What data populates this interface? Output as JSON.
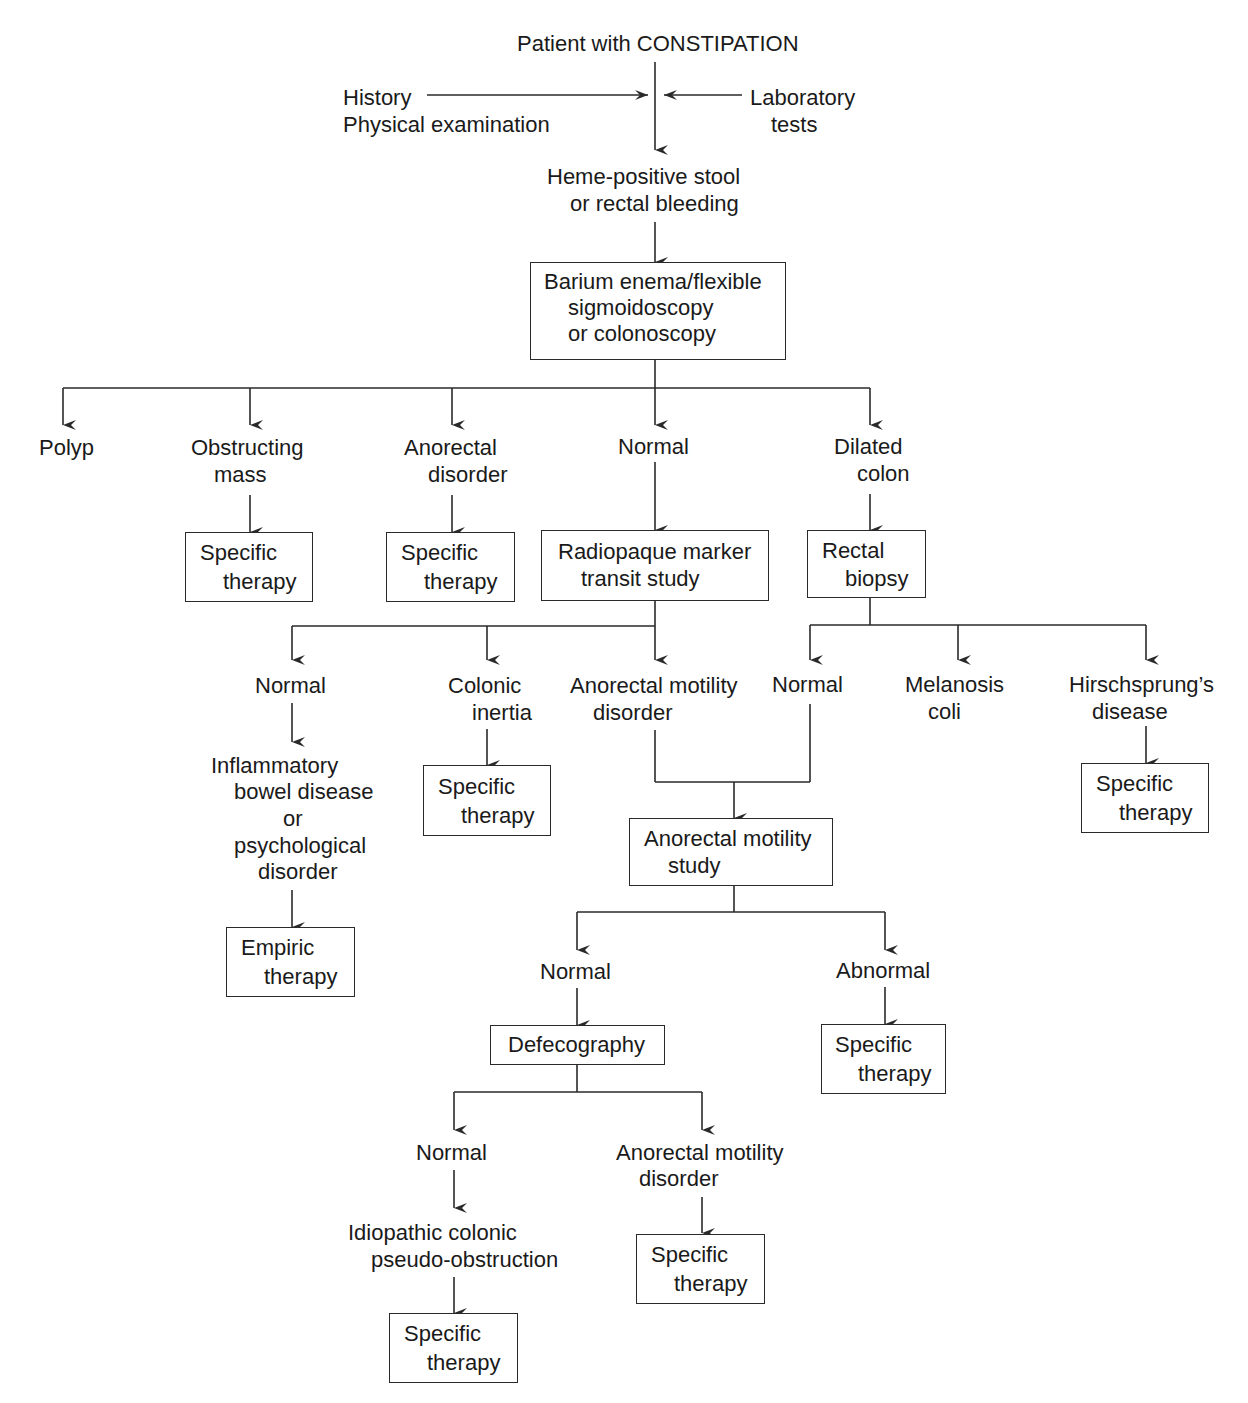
{
  "diagram": {
    "type": "clinical-decision-flowchart",
    "title": "Patient with CONSTIPATION",
    "inputs": {
      "left": [
        "History",
        "Physical examination"
      ],
      "right": [
        "Laboratory",
        "tests"
      ]
    },
    "nodes": {
      "root": "Patient with CONSTIPATION",
      "history_l1": "History",
      "history_l2": "Physical examination",
      "lab_l1": "Laboratory",
      "lab_l2": "tests",
      "heme_l1": "Heme-positive stool",
      "heme_l2": "or rectal bleeding",
      "barium_l1": "Barium enema/flexible",
      "barium_l2": "sigmoidoscopy",
      "barium_l3": "or colonoscopy",
      "polyp": "Polyp",
      "obstructing_l1": "Obstructing",
      "obstructing_l2": "mass",
      "anorectal_dis_l1": "Anorectal",
      "anorectal_dis_l2": "disorder",
      "normal1": "Normal",
      "dilated_l1": "Dilated",
      "dilated_l2": "colon",
      "spec_obstr_l1": "Specific",
      "spec_obstr_l2": "therapy",
      "spec_anorect_l1": "Specific",
      "spec_anorect_l2": "therapy",
      "radiopaque_l1": "Radiopaque marker",
      "radiopaque_l2": "transit study",
      "rectal_biopsy_l1": "Rectal",
      "rectal_biopsy_l2": "biopsy",
      "normal2": "Normal",
      "colonic_inertia_l1": "Colonic",
      "colonic_inertia_l2": "inertia",
      "anorectal_motility_dis_l1": "Anorectal motility",
      "anorectal_motility_dis_l2": "disorder",
      "normal3": "Normal",
      "melanosis_l1": "Melanosis",
      "melanosis_l2": "coli",
      "hirsch_l1": "Hirschsprung’s",
      "hirsch_l2": "disease",
      "ibd_l1": "Inflammatory",
      "ibd_l2": "bowel disease",
      "ibd_l3": "or",
      "ibd_l4": "psychological",
      "ibd_l5": "disorder",
      "spec_inertia_l1": "Specific",
      "spec_inertia_l2": "therapy",
      "spec_hirsch_l1": "Specific",
      "spec_hirsch_l2": "therapy",
      "ams_l1": "Anorectal motility",
      "ams_l2": "study",
      "empiric_l1": "Empiric",
      "empiric_l2": "therapy",
      "normal4": "Normal",
      "abnormal": "Abnormal",
      "defecography": "Defecography",
      "spec_abnormal_l1": "Specific",
      "spec_abnormal_l2": "therapy",
      "normal5": "Normal",
      "amd2_l1": "Anorectal motility",
      "amd2_l2": "disorder",
      "idiopathic_l1": "Idiopathic colonic",
      "idiopathic_l2": "pseudo-obstruction",
      "spec_amd2_l1": "Specific",
      "spec_amd2_l2": "therapy",
      "spec_idio_l1": "Specific",
      "spec_idio_l2": "therapy"
    },
    "edges": [
      [
        "Patient with CONSTIPATION",
        "Heme-positive stool or rectal bleeding"
      ],
      [
        "History / Physical examination",
        "main flow"
      ],
      [
        "Laboratory tests",
        "main flow"
      ],
      [
        "Heme-positive stool or rectal bleeding",
        "Barium enema/flexible sigmoidoscopy or colonoscopy"
      ],
      [
        "Barium enema/flexible sigmoidoscopy or colonoscopy",
        "Polyp"
      ],
      [
        "Barium enema/flexible sigmoidoscopy or colonoscopy",
        "Obstructing mass"
      ],
      [
        "Barium enema/flexible sigmoidoscopy or colonoscopy",
        "Anorectal disorder"
      ],
      [
        "Barium enema/flexible sigmoidoscopy or colonoscopy",
        "Normal"
      ],
      [
        "Barium enema/flexible sigmoidoscopy or colonoscopy",
        "Dilated colon"
      ],
      [
        "Obstructing mass",
        "Specific therapy"
      ],
      [
        "Anorectal disorder",
        "Specific therapy"
      ],
      [
        "Normal",
        "Radiopaque marker transit study"
      ],
      [
        "Dilated colon",
        "Rectal biopsy"
      ],
      [
        "Radiopaque marker transit study",
        "Normal"
      ],
      [
        "Radiopaque marker transit study",
        "Colonic inertia"
      ],
      [
        "Radiopaque marker transit study",
        "Anorectal motility disorder"
      ],
      [
        "Rectal biopsy",
        "Normal"
      ],
      [
        "Rectal biopsy",
        "Melanosis coli"
      ],
      [
        "Rectal biopsy",
        "Hirschsprung's disease"
      ],
      [
        "Normal",
        "Inflammatory bowel disease or psychological disorder"
      ],
      [
        "Inflammatory bowel disease or psychological disorder",
        "Empiric therapy"
      ],
      [
        "Colonic inertia",
        "Specific therapy"
      ],
      [
        "Hirschsprung's disease",
        "Specific therapy"
      ],
      [
        "Anorectal motility disorder",
        "Anorectal motility study"
      ],
      [
        "Normal (rectal biopsy)",
        "Anorectal motility study"
      ],
      [
        "Anorectal motility study",
        "Normal"
      ],
      [
        "Anorectal motility study",
        "Abnormal"
      ],
      [
        "Normal",
        "Defecography"
      ],
      [
        "Abnormal",
        "Specific therapy"
      ],
      [
        "Defecography",
        "Normal"
      ],
      [
        "Defecography",
        "Anorectal motility disorder"
      ],
      [
        "Normal",
        "Idiopathic colonic pseudo-obstruction"
      ],
      [
        "Idiopathic colonic pseudo-obstruction",
        "Specific therapy"
      ],
      [
        "Anorectal motility disorder",
        "Specific therapy"
      ]
    ]
  },
  "colors": {
    "line": "#2a2a2a",
    "text": "#1a1a1a",
    "background": "#ffffff"
  }
}
